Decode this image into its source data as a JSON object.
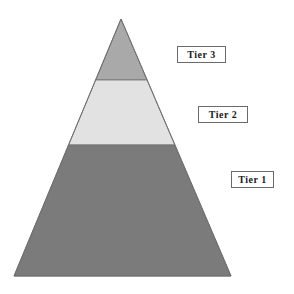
{
  "diagram": {
    "type": "pyramid",
    "title": "",
    "apex": {
      "x": 121,
      "y": 19
    },
    "base": {
      "y": 276,
      "left_x": 14,
      "right_x": 231
    },
    "outline_color": "#6e6e6e",
    "tiers": [
      {
        "id": "tier-3",
        "label": "Tier 3",
        "position": "top",
        "fill": "#a9a9a9",
        "y_top": 19,
        "y_bottom": 80,
        "label_box": {
          "x": 177,
          "y": 46,
          "w": 49,
          "h": 17
        }
      },
      {
        "id": "tier-2",
        "label": "Tier 2",
        "position": "middle",
        "fill": "#e2e2e2",
        "y_top": 80,
        "y_bottom": 145,
        "label_box": {
          "x": 198,
          "y": 106,
          "w": 50,
          "h": 17
        }
      },
      {
        "id": "tier-1",
        "label": "Tier 1",
        "position": "bottom",
        "fill": "#7b7b7b",
        "y_top": 145,
        "y_bottom": 276,
        "label_box": {
          "x": 231,
          "y": 171,
          "w": 43,
          "h": 17
        }
      }
    ]
  },
  "chart_data": {
    "type": "pyramid",
    "title": "",
    "categories": [
      "Tier 3",
      "Tier 2",
      "Tier 1"
    ],
    "order": "top-to-bottom",
    "fills": [
      "#a9a9a9",
      "#e2e2e2",
      "#7b7b7b"
    ],
    "tier_boundaries_px": [
      19,
      80,
      145,
      276
    ],
    "legend": "labels in boxes to the right of each tier",
    "grid": false
  }
}
